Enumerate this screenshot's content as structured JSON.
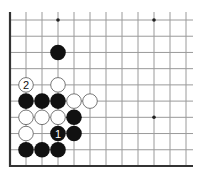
{
  "diagram": {
    "type": "go-board-fragment",
    "grid": {
      "columns": 12,
      "rows": 10,
      "origin_x": 10,
      "origin_y": 20,
      "spacing_x": 16,
      "spacing_y": 16.22,
      "top_extend": 8,
      "right_extend": 7,
      "left_edge": true,
      "bottom_edge": true,
      "line_color": "#9a9a9a",
      "edge_color": "#333333"
    },
    "star_points": [
      {
        "col": 3,
        "row": 0
      },
      {
        "col": 9,
        "row": 0
      },
      {
        "col": 9,
        "row": 6
      }
    ],
    "stones": [
      {
        "col": 3,
        "row": 2,
        "color": "black",
        "label": ""
      },
      {
        "col": 1,
        "row": 4,
        "color": "white",
        "label": "2"
      },
      {
        "col": 3,
        "row": 4,
        "color": "white",
        "label": ""
      },
      {
        "col": 1,
        "row": 5,
        "color": "black",
        "label": ""
      },
      {
        "col": 2,
        "row": 5,
        "color": "black",
        "label": ""
      },
      {
        "col": 3,
        "row": 5,
        "color": "black",
        "label": ""
      },
      {
        "col": 4,
        "row": 5,
        "color": "white",
        "label": ""
      },
      {
        "col": 5,
        "row": 5,
        "color": "white",
        "label": ""
      },
      {
        "col": 1,
        "row": 6,
        "color": "white",
        "label": ""
      },
      {
        "col": 2,
        "row": 6,
        "color": "white",
        "label": ""
      },
      {
        "col": 3,
        "row": 6,
        "color": "white",
        "label": ""
      },
      {
        "col": 4,
        "row": 6,
        "color": "black",
        "label": ""
      },
      {
        "col": 1,
        "row": 7,
        "color": "white",
        "label": ""
      },
      {
        "col": 3,
        "row": 7,
        "color": "black",
        "label": "1"
      },
      {
        "col": 4,
        "row": 7,
        "color": "black",
        "label": ""
      },
      {
        "col": 1,
        "row": 8,
        "color": "black",
        "label": ""
      },
      {
        "col": 2,
        "row": 8,
        "color": "black",
        "label": ""
      },
      {
        "col": 3,
        "row": 8,
        "color": "black",
        "label": ""
      }
    ],
    "colors": {
      "black_stone": "#111111",
      "white_stone": "#ffffff",
      "white_stone_border": "#555555",
      "star_point": "#222222"
    }
  }
}
